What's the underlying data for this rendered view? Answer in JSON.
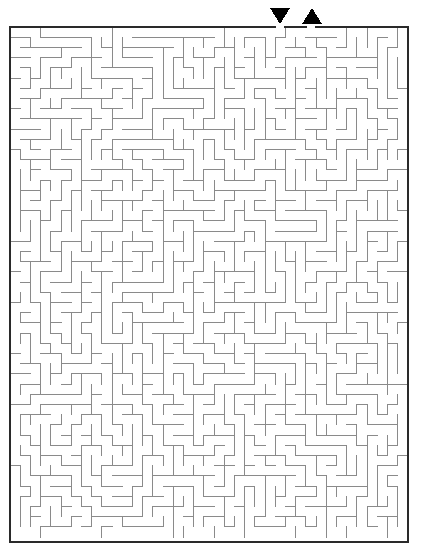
{
  "page": {
    "background_color": "#ffffff",
    "width": 421,
    "height": 557
  },
  "maze": {
    "name": "rectangular-perfect-maze",
    "columns": 39,
    "rows": 50,
    "cell_size": 10.2,
    "origin_x": 10,
    "origin_y": 27,
    "width": 398,
    "height": 515,
    "border_color": "#2a2a2a",
    "border_width": 2,
    "wall_color": "#8a8a8a",
    "wall_width": 1,
    "background_color": "#ffffff",
    "seed": 20240517,
    "entrance_column": 26,
    "exit_column": 29
  },
  "markers": {
    "entrance": {
      "name": "entrance-marker",
      "glyph": "down-triangle",
      "color": "#000000",
      "center_x": 280,
      "top_y": 8,
      "half_width": 10,
      "height": 16
    },
    "exit": {
      "name": "exit-marker",
      "glyph": "up-triangle",
      "color": "#000000",
      "center_x": 312,
      "top_y": 8,
      "half_width": 10,
      "height": 16
    }
  }
}
